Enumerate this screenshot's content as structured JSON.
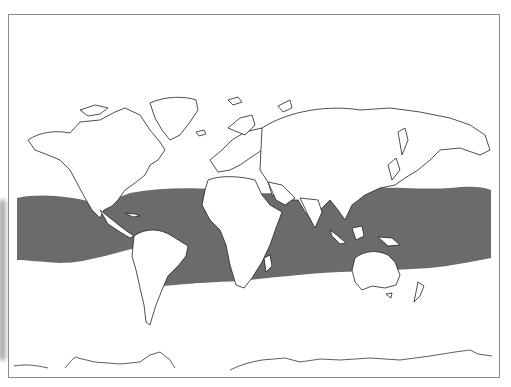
{
  "map": {
    "type": "world-distribution-map",
    "projection": "equirectangular-like, Pacific-centered split at Americas (Atlantic left-center)",
    "background_color": "#ffffff",
    "coastline_color": "#222222",
    "frame_color": "#8a8a8a",
    "range": {
      "label": "",
      "fill_color": "#6b6b6b",
      "description": "Shaded circumtropical band across Atlantic, Indian and Pacific Oceans"
    },
    "labels": []
  }
}
